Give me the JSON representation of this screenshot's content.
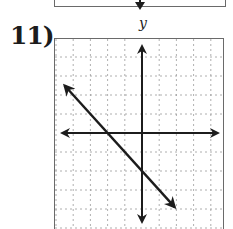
{
  "problem": {
    "number_label": "11)",
    "y_axis_label": "y"
  },
  "chart_data": {
    "type": "line",
    "title": "",
    "xlabel": "",
    "ylabel": "y",
    "xlim": [
      -5,
      5
    ],
    "ylim": [
      -5,
      5
    ],
    "grid": true,
    "grid_style": "dashed",
    "axes_arrows": true,
    "series": [
      {
        "name": "line",
        "equation": "y = -x - 2",
        "slope": -1,
        "y_intercept": -2,
        "x_intercept": -2,
        "x": [
          -4.5,
          1.9
        ],
        "y": [
          2.5,
          -3.9
        ],
        "arrows_both_ends": true
      }
    ]
  },
  "colors": {
    "ink": "#1c1c1c",
    "grid": "#9a9a9a",
    "border": "#6a6a6a"
  }
}
